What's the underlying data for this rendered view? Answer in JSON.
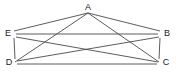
{
  "figure": {
    "type": "graph-diagram",
    "title": "",
    "background_color": "#ffffff",
    "edge_color": "#4a4a4a",
    "label_color": "#1a1a1a",
    "width": 176,
    "height": 75
  },
  "graph": {
    "name": "complete-graph-K5",
    "vertex_count": 5,
    "edge_count": 10,
    "vertices": [
      {
        "id": "A",
        "label": "A",
        "x": 88,
        "y": 9,
        "label_x": 88,
        "label_y": 8
      },
      {
        "id": "E",
        "label": "E",
        "x": 14,
        "y": 34,
        "label_x": 8,
        "label_y": 34
      },
      {
        "id": "B",
        "label": "B",
        "x": 160,
        "y": 34,
        "label_x": 167,
        "label_y": 34
      },
      {
        "id": "D",
        "label": "D",
        "x": 15,
        "y": 63,
        "label_x": 9,
        "label_y": 63
      },
      {
        "id": "C",
        "label": "C",
        "x": 159,
        "y": 63,
        "label_x": 166,
        "label_y": 63
      }
    ],
    "edges": [
      {
        "from": "A",
        "to": "E",
        "x1": 88,
        "y1": 13,
        "x2": 14,
        "y2": 31
      },
      {
        "from": "A",
        "to": "B",
        "x1": 88,
        "y1": 13,
        "x2": 160,
        "y2": 31
      },
      {
        "from": "A",
        "to": "D",
        "x1": 88,
        "y1": 13,
        "x2": 15,
        "y2": 62
      },
      {
        "from": "A",
        "to": "C",
        "x1": 88,
        "y1": 13,
        "x2": 159,
        "y2": 62
      },
      {
        "from": "E",
        "to": "B",
        "x1": 16,
        "y1": 34,
        "x2": 158,
        "y2": 34
      },
      {
        "from": "E",
        "to": "D",
        "x1": 14,
        "y1": 38,
        "x2": 15,
        "y2": 59
      },
      {
        "from": "E",
        "to": "C",
        "x1": 16,
        "y1": 37,
        "x2": 158,
        "y2": 62
      },
      {
        "from": "D",
        "to": "B",
        "x1": 17,
        "y1": 61,
        "x2": 159,
        "y2": 37
      },
      {
        "from": "D",
        "to": "C",
        "x1": 17,
        "y1": 64,
        "x2": 157,
        "y2": 64
      },
      {
        "from": "B",
        "to": "C",
        "x1": 160,
        "y1": 38,
        "x2": 159,
        "y2": 59
      }
    ]
  }
}
